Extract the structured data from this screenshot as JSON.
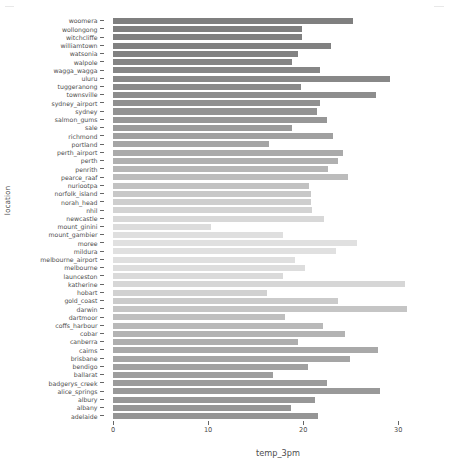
{
  "chart_data": {
    "type": "bar",
    "orientation": "horizontal",
    "title": "",
    "xlabel": "temp_3pm",
    "ylabel": "location",
    "xlim": [
      0,
      34.7
    ],
    "xticks": [
      0,
      10,
      20,
      30
    ],
    "xtick_labels": [
      "0",
      "10",
      "20",
      "30"
    ],
    "grid": false,
    "legend": null,
    "colormap": "gray-sequential-by-index",
    "categories": [
      "woomera",
      "wollongong",
      "witchcliffe",
      "williamtown",
      "watsonia",
      "walpole",
      "wagga_wagga",
      "uluru",
      "tuggeranong",
      "townsville",
      "sydney_airport",
      "sydney",
      "salmon_gums",
      "sale",
      "richmond",
      "portland",
      "perth_airport",
      "perth",
      "penrith",
      "pearce_raaf",
      "nuriootpa",
      "norfolk_island",
      "norah_head",
      "nhil",
      "newcastle",
      "mount_ginini",
      "mount_gambier",
      "moree",
      "mildura",
      "melbourne_airport",
      "melbourne",
      "launceston",
      "katherine",
      "hobart",
      "gold_coast",
      "darwin",
      "dartmoor",
      "coffs_harbour",
      "cobar",
      "canberra",
      "cairns",
      "brisbane",
      "bendigo",
      "ballarat",
      "badgerys_creek",
      "alice_springs",
      "albury",
      "albany",
      "adelaide"
    ],
    "values": [
      25.2,
      19.9,
      19.9,
      22.9,
      19.5,
      18.8,
      21.8,
      29.1,
      19.8,
      27.7,
      21.8,
      21.5,
      22.5,
      18.8,
      23.1,
      16.4,
      24.2,
      23.7,
      22.6,
      24.7,
      20.6,
      20.8,
      20.8,
      20.9,
      22.2,
      10.3,
      17.9,
      25.7,
      23.4,
      19.1,
      20.2,
      17.9,
      30.7,
      16.2,
      23.7,
      30.9,
      18.1,
      22.1,
      24.4,
      19.5,
      27.9,
      24.9,
      20.5,
      16.8,
      22.5,
      28.1,
      21.2,
      18.7,
      21.6
    ],
    "bar_colors": [
      "#7f7f7f",
      "#7f7f7f",
      "#808080",
      "#818181",
      "#828282",
      "#848484",
      "#868686",
      "#888888",
      "#8a8a8a",
      "#8d8d8d",
      "#909090",
      "#939393",
      "#979797",
      "#9b9b9b",
      "#a0a0a0",
      "#a5a5a5",
      "#aaaaaa",
      "#b0b0b0",
      "#b6b6b6",
      "#bcbcbc",
      "#c2c2c2",
      "#c8c8c8",
      "#cecece",
      "#d3d3d3",
      "#d8d8d8",
      "#dcdcdc",
      "#dfdfdf",
      "#e0e0e0",
      "#e0e0e0",
      "#dfdfdf",
      "#dddddd",
      "#dadada",
      "#d6d6d6",
      "#d1d1d1",
      "#cbcbcb",
      "#c5c5c5",
      "#bfbfbf",
      "#b9b9b9",
      "#b3b3b3",
      "#aeaeae",
      "#a9a9a9",
      "#a5a5a5",
      "#a1a1a1",
      "#9e9e9e",
      "#9b9b9b",
      "#999999",
      "#979797",
      "#969696",
      "#959595"
    ]
  },
  "axes": {
    "x_title": "temp_3pm",
    "y_title": "location"
  },
  "colors": {
    "axis_text": "#4d4d4d",
    "tick_mark": "#666666",
    "background": "#ffffff"
  }
}
